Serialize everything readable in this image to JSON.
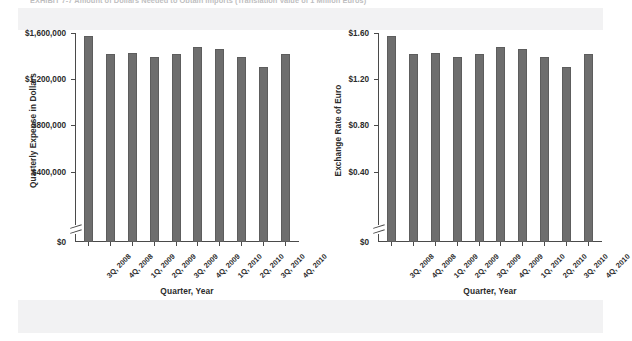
{
  "exhibit": {
    "caption": "EXHIBIT 7-7    Amount of Dollars Needed to Obtain Imports (Translation Value of 1 Million Euros)"
  },
  "chart_data": [
    {
      "id": "quarterly-expense",
      "type": "bar",
      "title": "",
      "xlabel": "Quarter, Year",
      "ylabel": "Quarterly Expense in Dollars",
      "categories": [
        "3Q, 2008",
        "4Q, 2008",
        "1Q, 2009",
        "2Q, 2009",
        "3Q, 2009",
        "4Q, 2009",
        "1Q, 2010",
        "2Q, 2010",
        "3Q, 2010",
        "4Q, 2010"
      ],
      "values": [
        1570000,
        1420000,
        1425000,
        1395000,
        1420000,
        1480000,
        1465000,
        1395000,
        1305000,
        1420000
      ],
      "ytick_labels": [
        "$1,600,000",
        "$1,200,000",
        "$800,000",
        "$400,000",
        "$0"
      ],
      "ytick_values": [
        1600000,
        1200000,
        800000,
        400000,
        0
      ],
      "ylim": [
        0,
        1600000
      ],
      "axis_break": true,
      "grid": false,
      "legend": "none",
      "bar_color": "#6e6e6e"
    },
    {
      "id": "exchange-rate-euro",
      "type": "bar",
      "title": "",
      "xlabel": "Quarter, Year",
      "ylabel": "Exchange Rate of Euro",
      "categories": [
        "3Q, 2008",
        "4Q, 2008",
        "1Q, 2009",
        "2Q, 2009",
        "3Q, 2009",
        "4Q, 2009",
        "1Q, 2010",
        "2Q, 2010",
        "3Q, 2010",
        "4Q, 2010"
      ],
      "values": [
        1.57,
        1.42,
        1.425,
        1.395,
        1.42,
        1.48,
        1.465,
        1.395,
        1.305,
        1.42
      ],
      "ytick_labels": [
        "$1.60",
        "$1.20",
        "$0.80",
        "$0.40",
        "$0"
      ],
      "ytick_values": [
        1.6,
        1.2,
        0.8,
        0.4,
        0
      ],
      "ylim": [
        0,
        1.6
      ],
      "axis_break": true,
      "grid": false,
      "legend": "none",
      "bar_color": "#6e6e6e"
    }
  ]
}
